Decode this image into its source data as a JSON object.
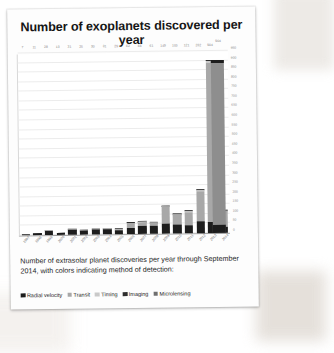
{
  "title": "Number of exoplanets discovered per year",
  "caption": "Number of extrasolar planet discoveries per year through September 2014, with colors indicating method of detection:",
  "legend": [
    {
      "label": "Radial velocity",
      "color": "#1d1d1d"
    },
    {
      "label": "Transit",
      "color": "#a8a8a8"
    },
    {
      "label": "Timing",
      "color": "#c9c9c9"
    },
    {
      "label": "Imaging",
      "color": "#2e2e2e"
    },
    {
      "label": "Microlensing",
      "color": "#6f6f6f"
    }
  ],
  "total_bar": {
    "label": "904",
    "value": 904,
    "color": "#8e8e8e"
  },
  "chart_data": {
    "type": "bar",
    "title": "Number of exoplanets discovered per year",
    "xlabel": "",
    "ylabel": "",
    "ylim": [
      0,
      950
    ],
    "grid": true,
    "stacked": true,
    "legend_position": "bottom",
    "categories": [
      "1997",
      "1998",
      "1999",
      "2000",
      "2001",
      "2002",
      "2003",
      "2004",
      "2005",
      "2006",
      "2007",
      "2008",
      "2009",
      "2010",
      "2011",
      "2012",
      "2013",
      "2014"
    ],
    "value_labels": [
      "7",
      "11",
      "28",
      "13",
      "31",
      "25",
      "30",
      "31",
      "29",
      "62",
      "66",
      "61",
      "149",
      "105",
      "121",
      "232",
      "904"
    ],
    "totals": [
      7,
      11,
      28,
      13,
      31,
      25,
      30,
      31,
      29,
      62,
      66,
      61,
      149,
      105,
      121,
      232,
      904,
      120
    ],
    "series": [
      {
        "name": "Radial velocity",
        "color": "#1d1d1d",
        "values": [
          7,
          10,
          23,
          12,
          26,
          22,
          25,
          24,
          22,
          34,
          42,
          40,
          53,
          47,
          42,
          63,
          58,
          29
        ]
      },
      {
        "name": "Transit",
        "color": "#a8a8a8",
        "values": [
          0,
          0,
          1,
          0,
          2,
          1,
          3,
          4,
          4,
          23,
          18,
          15,
          86,
          50,
          68,
          158,
          830,
          85
        ]
      },
      {
        "name": "Timing",
        "color": "#c9c9c9",
        "values": [
          0,
          1,
          3,
          0,
          2,
          1,
          1,
          2,
          2,
          3,
          3,
          3,
          7,
          4,
          6,
          6,
          9,
          3
        ]
      },
      {
        "name": "Imaging",
        "color": "#2e2e2e",
        "values": [
          0,
          0,
          1,
          1,
          1,
          1,
          1,
          1,
          1,
          1,
          2,
          2,
          2,
          3,
          4,
          4,
          5,
          2
        ]
      },
      {
        "name": "Microlensing",
        "color": "#6f6f6f",
        "values": [
          0,
          0,
          0,
          0,
          0,
          0,
          0,
          0,
          0,
          1,
          1,
          1,
          1,
          1,
          1,
          1,
          2,
          1
        ]
      }
    ],
    "yticks": [
      0,
      50,
      100,
      150,
      200,
      250,
      300,
      350,
      400,
      450,
      500,
      550,
      600,
      650,
      700,
      750,
      800,
      850,
      900,
      950
    ]
  }
}
